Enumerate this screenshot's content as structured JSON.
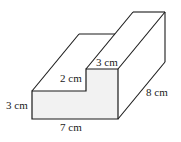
{
  "diagram": {
    "colors": {
      "stroke": "#1a1a1a",
      "front_face_fill": "#f2f2f2",
      "background": "#ffffff"
    },
    "labels": {
      "front_height": "3 cm",
      "front_width": "7 cm",
      "step_height": "2 cm",
      "top_width": "3 cm",
      "depth": "8 cm"
    }
  }
}
